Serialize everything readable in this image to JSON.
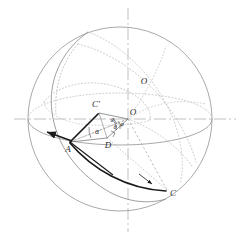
{
  "figure": {
    "background_color": "#ffffff",
    "width": 241,
    "height": 238
  },
  "colors": {
    "sphere_outline": "#9a9a9a",
    "great_circle_solid": "#8e8e8e",
    "great_circle_dotted": "#b9b9b9",
    "axis": "#a8a8a8",
    "heavy_stroke": "#1a1a1a",
    "thin_construction": "#6f6f6f",
    "label_text": "#2b2b2b"
  },
  "sphere": {
    "center_x": 120,
    "center_y": 119,
    "radius": 92,
    "label": "O"
  },
  "axes": {
    "horizontal": {
      "y": 119,
      "x_start": 14,
      "x_end": 236,
      "style": "dash-dot"
    },
    "vertical": {
      "x": 128,
      "y_start": 8,
      "y_end": 232,
      "style": "dash-dot"
    }
  },
  "points": [
    {
      "name": "A",
      "label": "A",
      "x": 70,
      "y": 142,
      "label_dx": -2,
      "label_dy": 8
    },
    {
      "name": "C",
      "label": "C",
      "x": 167,
      "y": 190,
      "label_dx": 6,
      "label_dy": 4
    },
    {
      "name": "Cp",
      "label": "C'",
      "x": 99,
      "y": 113,
      "label_dx": -3,
      "label_dy": -8
    },
    {
      "name": "D",
      "label": "D",
      "x": 107,
      "y": 138,
      "label_dx": 1,
      "label_dy": 8
    },
    {
      "name": "O",
      "label": "O",
      "x": 128,
      "y": 119,
      "label_dx": 5,
      "label_dy": -6
    },
    {
      "name": "O_upper",
      "label": "O",
      "x": 144,
      "y": 82,
      "label_dx": 0,
      "label_dy": 0
    }
  ],
  "angles": [
    {
      "name": "alpha",
      "label": "α",
      "x": 97,
      "y": 132
    },
    {
      "name": "theta",
      "label": "θ",
      "x": 115,
      "y": 128
    },
    {
      "name": "phi",
      "label": "φ",
      "x": 121,
      "y": 125
    },
    {
      "name": "psi",
      "label": "θ",
      "x": 112,
      "y": 122
    }
  ],
  "legend_note": ""
}
